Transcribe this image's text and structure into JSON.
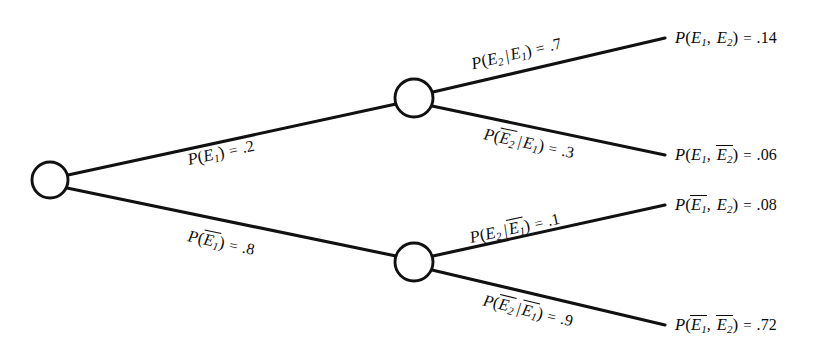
{
  "diagram": {
    "type": "probability-tree",
    "background_color": "#ffffff",
    "stroke_color": "#111111",
    "text_color": "#0a0a0a",
    "nodes": [
      {
        "id": "root",
        "label": "root-node",
        "cx": 50,
        "cy": 180,
        "r": 18
      },
      {
        "id": "upper",
        "label": "upper-event-node",
        "cx": 414,
        "cy": 98,
        "r": 19
      },
      {
        "id": "lower",
        "label": "lower-event-node",
        "cx": 414,
        "cy": 262,
        "r": 19
      }
    ],
    "branches": [
      {
        "id": "b1",
        "from": "root",
        "to": "upper",
        "x1": 68,
        "y1": 175,
        "x2": 396,
        "y2": 104
      },
      {
        "id": "b2",
        "from": "root",
        "to": "lower",
        "x1": 67,
        "y1": 188,
        "x2": 396,
        "y2": 256
      },
      {
        "id": "b3",
        "from": "upper",
        "to": "leaf1",
        "x1": 433,
        "y1": 92,
        "x2": 665,
        "y2": 38
      },
      {
        "id": "b4",
        "from": "upper",
        "to": "leaf2",
        "x1": 432,
        "y1": 106,
        "x2": 665,
        "y2": 155
      },
      {
        "id": "b5",
        "from": "lower",
        "to": "leaf3",
        "x1": 433,
        "y1": 256,
        "x2": 665,
        "y2": 205
      },
      {
        "id": "b6",
        "from": "lower",
        "to": "leaf4",
        "x1": 432,
        "y1": 270,
        "x2": 665,
        "y2": 325
      }
    ],
    "branch_labels": [
      {
        "id": "lbl-b1",
        "name": "branch-label-e1",
        "text": "P(E1) = .2",
        "probability": ".2",
        "event": "E1",
        "negated": false,
        "conditional": false,
        "x": 190,
        "y": 151,
        "rotate": -12.5
      },
      {
        "id": "lbl-b2",
        "name": "branch-label-e1-bar",
        "text": "P(E1̅) = .8",
        "probability": ".8",
        "event": "E1",
        "negated": true,
        "conditional": false,
        "x": 186,
        "y": 227,
        "rotate": 11.8
      },
      {
        "id": "lbl-b3",
        "name": "branch-label-e2-given-e1",
        "text": "P(E2|E1) = .7",
        "probability": ".7",
        "event": "E2",
        "negated": false,
        "conditional": true,
        "given": "E1",
        "given_negated": false,
        "x": 474,
        "y": 55,
        "rotate": -13.2
      },
      {
        "id": "lbl-b4",
        "name": "branch-label-e2-bar-given-e1",
        "text": "P(E2̅|E1) = .3",
        "probability": ".3",
        "event": "E2",
        "negated": true,
        "conditional": true,
        "given": "E1",
        "given_negated": false,
        "x": 482,
        "y": 125,
        "rotate": 11.9
      },
      {
        "id": "lbl-b5",
        "name": "branch-label-e2-given-e1-bar",
        "text": "P(E2|E1̅) = .1",
        "probability": ".1",
        "event": "E2",
        "negated": false,
        "conditional": true,
        "given": "E1",
        "given_negated": true,
        "x": 472,
        "y": 229,
        "rotate": -12.4
      },
      {
        "id": "lbl-b6",
        "name": "branch-label-e2-bar-given-e1-bar",
        "text": "P(E2̅|E1̅) = .9",
        "probability": ".9",
        "event": "E2",
        "negated": true,
        "conditional": true,
        "given": "E1",
        "given_negated": true,
        "x": 481,
        "y": 291,
        "rotate": 13.4
      }
    ],
    "outcomes": [
      {
        "id": "leaf1",
        "name": "outcome-e1-e2",
        "text": "P(E1, E2) = .14",
        "probability": ".14",
        "first": "E1",
        "first_negated": false,
        "second": "E2",
        "second_negated": false,
        "x": 675,
        "y": 29
      },
      {
        "id": "leaf2",
        "name": "outcome-e1-e2-bar",
        "text": "P(E1, E2̅) = .06",
        "probability": ".06",
        "first": "E1",
        "first_negated": false,
        "second": "E2",
        "second_negated": true,
        "x": 675,
        "y": 146
      },
      {
        "id": "leaf3",
        "name": "outcome-e1-bar-e2",
        "text": "P(E1̅, E2) = .08",
        "probability": ".08",
        "first": "E1",
        "first_negated": true,
        "second": "E2",
        "second_negated": false,
        "x": 675,
        "y": 196
      },
      {
        "id": "leaf4",
        "name": "outcome-e1-bar-e2-bar",
        "text": "P(E1̅, E2̅) = .72",
        "probability": ".72",
        "first": "E1",
        "first_negated": true,
        "second": "E2",
        "second_negated": true,
        "x": 675,
        "y": 316
      }
    ],
    "symbols": {
      "fn": "P",
      "open_paren": "(",
      "close_paren": ")",
      "event_letter": "E",
      "sub_1": "1",
      "sub_2": "2",
      "conditional_bar": "|",
      "comma": ",",
      "equals": "="
    }
  }
}
